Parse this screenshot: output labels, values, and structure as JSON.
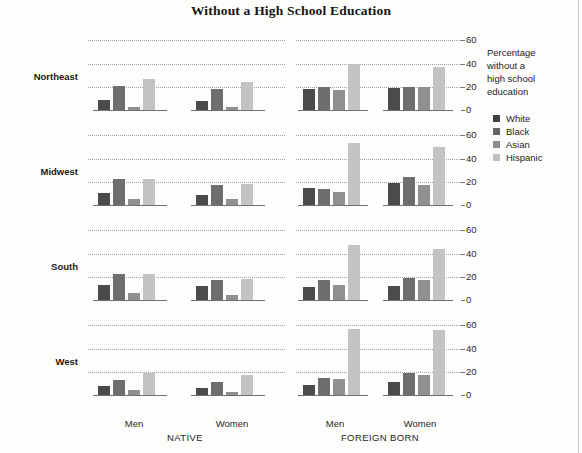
{
  "title": "Without a High School Education",
  "legend": {
    "axis_title": "Percentage without a high school education",
    "axis_title_lines": [
      "Percentage",
      "without a",
      "high school",
      "education"
    ],
    "items": [
      {
        "label": "White",
        "color": "#4b4b4d"
      },
      {
        "label": "Black",
        "color": "#6d6e70"
      },
      {
        "label": "Asian",
        "color": "#8e9092"
      },
      {
        "label": "Hispanic",
        "color": "#c2c3c2"
      }
    ]
  },
  "axis": {
    "ticks": [
      "0",
      "20",
      "40",
      "60"
    ],
    "tick_values": [
      0,
      20,
      40,
      60
    ],
    "ymin": 0,
    "ymax": 62
  },
  "strips": [
    {
      "label": "NATIVE"
    },
    {
      "label": "FOREIGN BORN"
    }
  ],
  "gender_labels": [
    "Men",
    "Women",
    "Men",
    "Women"
  ],
  "rows": [
    "Northeast",
    "Midwest",
    "South",
    "West"
  ],
  "chart_data": {
    "type": "bar",
    "title": "Without a High School Education",
    "xlabel": "",
    "ylabel": "Percentage without a high school education",
    "ylim": [
      0,
      62
    ],
    "yticks": [
      0,
      20,
      40,
      60
    ],
    "grid": true,
    "legend_position": "right",
    "layout": "trellis 4 rows (region) x 4 column groups (nativity x sex)",
    "series": [
      {
        "name": "White",
        "color": "#4b4b4d"
      },
      {
        "name": "Black",
        "color": "#6d6e70"
      },
      {
        "name": "Asian",
        "color": "#8e9092"
      },
      {
        "name": "Hispanic",
        "color": "#c2c3c2"
      }
    ],
    "panels": [
      {
        "region": "Northeast",
        "groups": [
          {
            "nativity": "NATIVE",
            "sex": "Men",
            "values": [
              9,
              21,
              3,
              27
            ]
          },
          {
            "nativity": "NATIVE",
            "sex": "Women",
            "values": [
              8,
              18,
              3,
              24
            ]
          },
          {
            "nativity": "FOREIGN BORN",
            "sex": "Men",
            "values": [
              18,
              20,
              17,
              40
            ]
          },
          {
            "nativity": "FOREIGN BORN",
            "sex": "Women",
            "values": [
              19,
              20,
              20,
              37
            ]
          }
        ]
      },
      {
        "region": "Midwest",
        "groups": [
          {
            "nativity": "NATIVE",
            "sex": "Men",
            "values": [
              10,
              22,
              5,
              22
            ]
          },
          {
            "nativity": "NATIVE",
            "sex": "Women",
            "values": [
              9,
              17,
              5,
              18
            ]
          },
          {
            "nativity": "FOREIGN BORN",
            "sex": "Men",
            "values": [
              15,
              14,
              11,
              53
            ]
          },
          {
            "nativity": "FOREIGN BORN",
            "sex": "Women",
            "values": [
              19,
              24,
              17,
              50
            ]
          }
        ]
      },
      {
        "region": "South",
        "groups": [
          {
            "nativity": "NATIVE",
            "sex": "Men",
            "values": [
              13,
              22,
              6,
              22
            ]
          },
          {
            "nativity": "NATIVE",
            "sex": "Women",
            "values": [
              12,
              17,
              4,
              18
            ]
          },
          {
            "nativity": "FOREIGN BORN",
            "sex": "Men",
            "values": [
              11,
              17,
              13,
              47
            ]
          },
          {
            "nativity": "FOREIGN BORN",
            "sex": "Women",
            "values": [
              12,
              19,
              17,
              44
            ]
          }
        ]
      },
      {
        "region": "West",
        "groups": [
          {
            "nativity": "NATIVE",
            "sex": "Men",
            "values": [
              8,
              13,
              4,
              19
            ]
          },
          {
            "nativity": "NATIVE",
            "sex": "Women",
            "values": [
              6,
              11,
              3,
              17
            ]
          },
          {
            "nativity": "FOREIGN BORN",
            "sex": "Men",
            "values": [
              9,
              15,
              14,
              57
            ]
          },
          {
            "nativity": "FOREIGN BORN",
            "sex": "Women",
            "values": [
              11,
              19,
              17,
              56
            ]
          }
        ]
      }
    ]
  }
}
